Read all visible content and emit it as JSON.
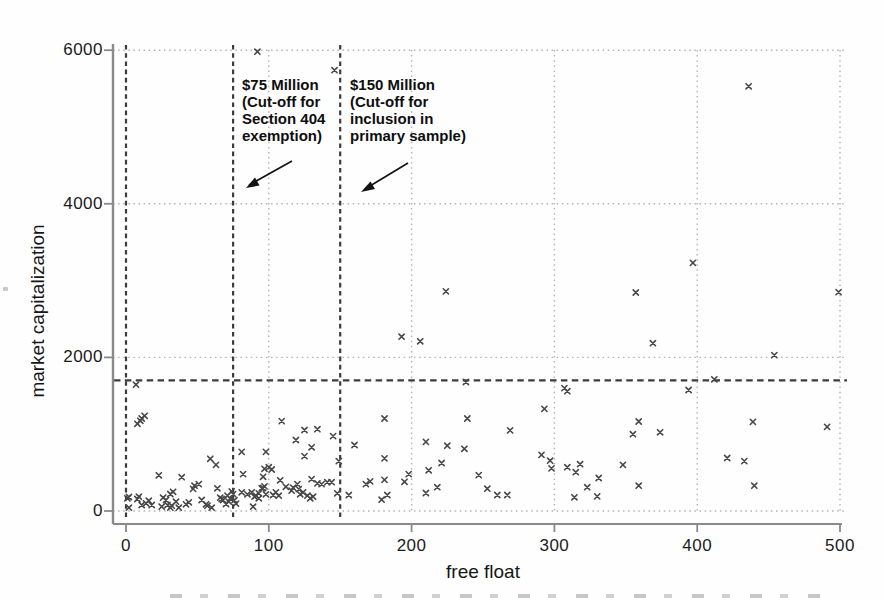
{
  "figure": {
    "xlabel": "free float",
    "ylabel": "market capitalization"
  },
  "annotations": {
    "sec404": {
      "lines": [
        "$75 Million",
        "(Cut-off for",
        "Section 404",
        "exemption)"
      ]
    },
    "primary": {
      "lines": [
        "$150 Million",
        "(Cut-off for",
        "inclusion in",
        "primary sample)"
      ]
    }
  },
  "colors": {
    "marker": "#474747",
    "grid_dotted": "#b3b3b3",
    "cutoff_dashed": "#3c3c3c",
    "axis": "#8a8a8a",
    "arrow": "#141414",
    "text": "#1b1b1b"
  },
  "chart_data": {
    "type": "scatter",
    "marker": "x",
    "title": "",
    "xlabel": "free float",
    "ylabel": "market capitalization",
    "xlim": [
      0,
      500
    ],
    "ylim": [
      0,
      6000
    ],
    "x_ticks": [
      0,
      100,
      200,
      300,
      400,
      500
    ],
    "y_ticks": [
      0,
      2000,
      4000,
      6000
    ],
    "grid": "dotted gridlines at every x tick (100-500) and y tick",
    "legend": "none",
    "cutoff_vlines": [
      {
        "x": 0,
        "label": ""
      },
      {
        "x": 75,
        "label": "$75 Million (Cut-off for Section 404 exemption)"
      },
      {
        "x": 150,
        "label": "$150 Million (Cut-off for inclusion in primary sample)"
      }
    ],
    "cutoff_hline": {
      "y": 1700
    },
    "points": [
      [
        92,
        5980
      ],
      [
        146,
        5740
      ],
      [
        436,
        5530
      ],
      [
        397,
        3230
      ],
      [
        224,
        2860
      ],
      [
        357,
        2845
      ],
      [
        499,
        2850
      ],
      [
        193,
        2270
      ],
      [
        206,
        2210
      ],
      [
        369,
        2185
      ],
      [
        454,
        2030
      ],
      [
        412,
        1715
      ],
      [
        238,
        1680
      ],
      [
        7,
        1645
      ],
      [
        307,
        1600
      ],
      [
        309,
        1560
      ],
      [
        394,
        1575
      ],
      [
        293,
        1330
      ],
      [
        8,
        1135
      ],
      [
        10,
        1175
      ],
      [
        11,
        1205
      ],
      [
        13,
        1240
      ],
      [
        181,
        1205
      ],
      [
        239,
        1205
      ],
      [
        109,
        1170
      ],
      [
        359,
        1165
      ],
      [
        439,
        1160
      ],
      [
        125,
        1055
      ],
      [
        134,
        1065
      ],
      [
        269,
        1050
      ],
      [
        491,
        1095
      ],
      [
        374,
        1025
      ],
      [
        355,
        1000
      ],
      [
        145,
        975
      ],
      [
        119,
        925
      ],
      [
        210,
        900
      ],
      [
        225,
        850
      ],
      [
        160,
        860
      ],
      [
        130,
        830
      ],
      [
        237,
        810
      ],
      [
        81,
        770
      ],
      [
        98,
        770
      ],
      [
        291,
        730
      ],
      [
        125,
        715
      ],
      [
        421,
        690
      ],
      [
        181,
        685
      ],
      [
        59,
        680
      ],
      [
        149,
        650
      ],
      [
        433,
        650
      ],
      [
        297,
        655
      ],
      [
        221,
        625
      ],
      [
        63,
        600
      ],
      [
        348,
        600
      ],
      [
        318,
        610
      ],
      [
        309,
        570
      ],
      [
        298,
        555
      ],
      [
        100,
        570
      ],
      [
        97,
        550
      ],
      [
        102,
        540
      ],
      [
        212,
        530
      ],
      [
        315,
        505
      ],
      [
        23,
        465
      ],
      [
        39,
        440
      ],
      [
        96,
        445
      ],
      [
        82,
        480
      ],
      [
        108,
        400
      ],
      [
        247,
        468
      ],
      [
        198,
        480
      ],
      [
        195,
        380
      ],
      [
        171,
        385
      ],
      [
        168,
        350
      ],
      [
        181,
        405
      ],
      [
        130,
        415
      ],
      [
        112,
        315
      ],
      [
        117,
        305
      ],
      [
        120,
        350
      ],
      [
        48,
        330
      ],
      [
        51,
        350
      ],
      [
        64,
        295
      ],
      [
        96,
        300
      ],
      [
        137,
        350
      ],
      [
        141,
        375
      ],
      [
        144,
        375
      ],
      [
        134,
        360
      ],
      [
        331,
        430
      ],
      [
        440,
        330
      ],
      [
        359,
        330
      ],
      [
        323,
        310
      ],
      [
        253,
        290
      ],
      [
        218,
        310
      ],
      [
        116,
        265
      ],
      [
        121,
        285
      ],
      [
        31,
        222
      ],
      [
        33,
        250
      ],
      [
        47,
        288
      ],
      [
        71,
        200
      ],
      [
        73,
        160
      ],
      [
        75,
        220
      ],
      [
        76,
        140
      ],
      [
        77,
        95
      ],
      [
        74,
        255
      ],
      [
        88,
        243
      ],
      [
        85,
        217
      ],
      [
        91,
        199
      ],
      [
        93,
        230
      ],
      [
        98,
        217
      ],
      [
        103,
        208
      ],
      [
        105,
        243
      ],
      [
        107,
        199
      ],
      [
        122,
        217
      ],
      [
        124,
        243
      ],
      [
        127,
        199
      ],
      [
        129,
        165
      ],
      [
        131,
        186
      ],
      [
        148,
        230
      ],
      [
        156,
        208
      ],
      [
        179,
        147
      ],
      [
        183,
        208
      ],
      [
        210,
        234
      ],
      [
        260,
        208
      ],
      [
        267,
        208
      ],
      [
        314,
        178
      ],
      [
        330,
        190
      ],
      [
        26,
        173
      ],
      [
        28,
        143
      ],
      [
        29,
        78
      ],
      [
        25,
        56
      ],
      [
        31,
        43
      ],
      [
        32,
        69
      ],
      [
        35,
        121
      ],
      [
        37,
        43
      ],
      [
        42,
        87
      ],
      [
        44,
        113
      ],
      [
        53,
        143
      ],
      [
        56,
        87
      ],
      [
        57,
        69
      ],
      [
        60,
        43
      ],
      [
        66,
        173
      ],
      [
        68,
        143
      ],
      [
        2,
        182
      ],
      [
        9,
        186
      ],
      [
        1,
        165
      ],
      [
        2,
        43
      ],
      [
        8,
        156
      ],
      [
        11,
        78
      ],
      [
        14,
        100
      ],
      [
        16,
        134
      ],
      [
        18,
        78
      ],
      [
        89,
        56
      ],
      [
        90,
        186
      ],
      [
        93,
        165
      ],
      [
        95,
        295
      ],
      [
        97,
        320
      ],
      [
        67,
        156
      ],
      [
        70,
        91
      ],
      [
        72,
        121
      ],
      [
        81,
        243
      ]
    ]
  }
}
